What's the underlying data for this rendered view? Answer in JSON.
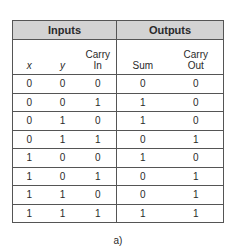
{
  "table": {
    "groups": [
      {
        "label": "Inputs",
        "span": 3
      },
      {
        "label": "Outputs",
        "span": 2
      }
    ],
    "columns": [
      {
        "line1": "",
        "line2": "x",
        "italic": true
      },
      {
        "line1": "",
        "line2": "y",
        "italic": true
      },
      {
        "line1": "Carry",
        "line2": "In",
        "italic": false
      },
      {
        "line1": "",
        "line2": "Sum",
        "italic": false
      },
      {
        "line1": "Carry",
        "line2": "Out",
        "italic": false
      }
    ],
    "rows": [
      [
        "0",
        "0",
        "0",
        "0",
        "0"
      ],
      [
        "0",
        "0",
        "1",
        "1",
        "0"
      ],
      [
        "0",
        "1",
        "0",
        "1",
        "0"
      ],
      [
        "0",
        "1",
        "1",
        "0",
        "1"
      ],
      [
        "1",
        "0",
        "0",
        "1",
        "0"
      ],
      [
        "1",
        "0",
        "1",
        "0",
        "1"
      ],
      [
        "1",
        "1",
        "0",
        "0",
        "1"
      ],
      [
        "1",
        "1",
        "1",
        "1",
        "1"
      ]
    ]
  },
  "caption": "a)",
  "colors": {
    "header_bg": "#d3d3d3",
    "border": "#555555"
  }
}
